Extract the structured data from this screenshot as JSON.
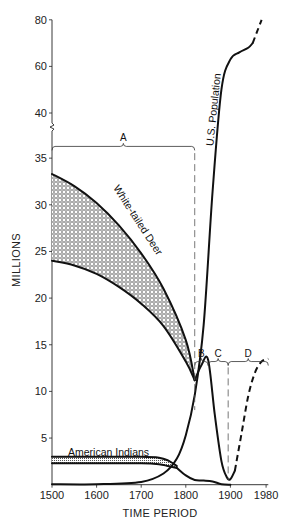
{
  "chart_data": {
    "type": "line",
    "title": "",
    "xlabel": "TIME PERIOD",
    "ylabel": "MILLIONS",
    "xlim": [
      1500,
      1990
    ],
    "ylim": [
      0,
      80
    ],
    "y_axis_break": {
      "lower_range": [
        0,
        35
      ],
      "upper_range": [
        40,
        80
      ]
    },
    "x_ticks": [
      1500,
      1600,
      1700,
      1800,
      1900,
      1980
    ],
    "y_ticks": [
      5,
      10,
      15,
      20,
      25,
      30,
      35,
      40,
      60,
      80
    ],
    "grid": false,
    "series": [
      {
        "name": "White-tailed Deer (upper estimate)",
        "x": [
          1500,
          1550,
          1600,
          1650,
          1700,
          1750,
          1800,
          1820
        ],
        "y": [
          33.3,
          32.0,
          30.2,
          27.8,
          24.8,
          21.0,
          15.5,
          11.2
        ]
      },
      {
        "name": "White-tailed Deer (lower estimate)",
        "x": [
          1500,
          1550,
          1600,
          1650,
          1700,
          1750,
          1800,
          1820
        ],
        "y": [
          24.0,
          23.5,
          22.6,
          21.2,
          19.4,
          17.0,
          13.2,
          11.2
        ]
      },
      {
        "name": "White-tailed Deer",
        "x": [
          1820,
          1835,
          1850,
          1865,
          1880,
          1892,
          1900,
          1910
        ],
        "y": [
          11.2,
          12.8,
          13.4,
          7.5,
          2.5,
          0.8,
          0.6,
          1.5
        ]
      },
      {
        "name": "White-tailed Deer (projected)",
        "dashed": true,
        "x": [
          1910,
          1925,
          1940,
          1955,
          1970,
          1985
        ],
        "y": [
          1.5,
          5.5,
          9.5,
          12.0,
          13.2,
          13.5
        ]
      },
      {
        "name": "U.S. Population",
        "x": [
          1500,
          1600,
          1700,
          1750,
          1780,
          1800,
          1820,
          1840,
          1860,
          1880,
          1900,
          1920,
          1940,
          1950
        ],
        "y": [
          0.05,
          0.05,
          0.3,
          1.2,
          2.8,
          5.3,
          9.6,
          17.1,
          31.4,
          50.2,
          63,
          66,
          68,
          70
        ]
      },
      {
        "name": "U.S. Population (projected)",
        "dashed": true,
        "x": [
          1950,
          1960,
          1970
        ],
        "y": [
          70,
          75,
          80
        ]
      },
      {
        "name": "American Indians (upper)",
        "x": [
          1500,
          1600,
          1700,
          1740,
          1760,
          1780
        ],
        "y": [
          3.0,
          3.0,
          3.0,
          2.9,
          2.6,
          2.0
        ]
      },
      {
        "name": "American Indians (lower)",
        "x": [
          1500,
          1600,
          1700,
          1740,
          1760,
          1780
        ],
        "y": [
          2.3,
          2.3,
          2.3,
          2.2,
          2.0,
          1.8
        ]
      },
      {
        "name": "American Indians",
        "x": [
          1780,
          1800,
          1820,
          1840,
          1860,
          1880,
          1900
        ],
        "y": [
          1.8,
          1.0,
          0.5,
          0.45,
          0.35,
          0.05,
          0.0
        ]
      }
    ],
    "annotations": [
      {
        "text": "White-tailed Deer",
        "type": "series-label"
      },
      {
        "text": "U.S. Population",
        "type": "series-label"
      },
      {
        "text": "American Indians",
        "type": "series-label"
      },
      {
        "text": "A",
        "type": "period-bracket",
        "x_range": [
          1500,
          1820
        ]
      },
      {
        "text": "B",
        "type": "period-bracket",
        "x_range": [
          1820,
          1850
        ]
      },
      {
        "text": "C",
        "type": "period-bracket",
        "x_range": [
          1850,
          1895
        ]
      },
      {
        "text": "D",
        "type": "period-bracket",
        "x_range": [
          1895,
          1985
        ]
      }
    ]
  }
}
